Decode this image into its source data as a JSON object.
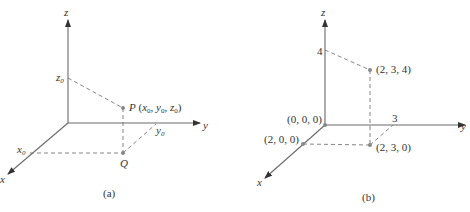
{
  "panels": [
    {
      "id": "a",
      "caption": "(a)",
      "axes": {
        "x": "x",
        "y": "y",
        "z": "z"
      },
      "ticks": {
        "x": "x",
        "y": "y",
        "z": "z"
      },
      "tick_subscript": "0",
      "point_P": {
        "name": "P",
        "coords_open": "(",
        "coords_close": ")",
        "sep": ", "
      },
      "point_Q": {
        "name": "Q"
      }
    },
    {
      "id": "b",
      "caption": "(b)",
      "axes": {
        "x": "x",
        "y": "y",
        "z": "z"
      },
      "ticks": {
        "y": "3",
        "z": "4"
      },
      "points": {
        "origin": "(0, 0, 0)",
        "x_point": "(2, 0, 0)",
        "base_point": "(2, 3, 0)",
        "top_point": "(2, 3, 4)"
      }
    }
  ]
}
